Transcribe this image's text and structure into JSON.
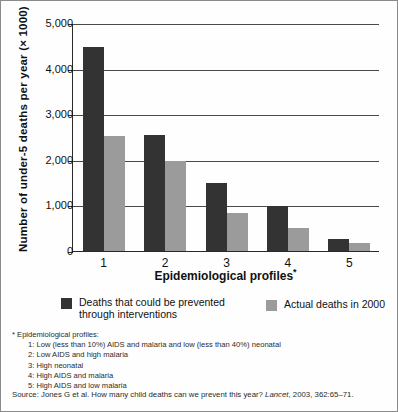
{
  "chart_data": {
    "type": "bar",
    "title": "",
    "xlabel": "Epidemiological profiles*",
    "ylabel": "Number of under-5 deaths per year (× 1000)",
    "categories": [
      "1",
      "2",
      "3",
      "4",
      "5"
    ],
    "ylim": [
      0,
      5000
    ],
    "yticks": [
      0,
      1000,
      2000,
      3000,
      4000,
      5000
    ],
    "ytick_labels": [
      "0",
      "1,000",
      "2,000",
      "3,000",
      "4,000",
      "5,000"
    ],
    "grid": true,
    "legend_position": "below",
    "series": [
      {
        "name": "Deaths that could be prevented through interventions",
        "color": "#333333",
        "values": [
          4470,
          2550,
          1500,
          980,
          270
        ]
      },
      {
        "name": "Actual deaths in 2000",
        "color": "#9b9b9b",
        "values": [
          2530,
          1970,
          830,
          500,
          170
        ]
      }
    ]
  },
  "axes": {
    "y_title": "Number of under-5 deaths per year (× 1000)",
    "x_title_main": "Epidemiological profiles",
    "x_title_marker": "*",
    "y_tick_labels": [
      "5,000",
      "4,000",
      "3,000",
      "2,000",
      "1,000",
      "0"
    ],
    "x_tick_labels": [
      "1",
      "2",
      "3",
      "4",
      "5"
    ]
  },
  "legend": {
    "items": [
      {
        "label": "Deaths that could be prevented through interventions",
        "color": "#333333"
      },
      {
        "label": "Actual deaths in 2000",
        "color": "#9b9b9b"
      }
    ]
  },
  "footnotes": {
    "heading": "* Epidemiological profiles:",
    "items": [
      "1: Low (less than 10%) AIDS and malaria and low (less than 40%) neonatal",
      "2: Low AIDS and high malaria",
      "3: High neonatal",
      "4: High AIDS and malaria",
      "5: High AIDS and low malaria"
    ]
  },
  "source": {
    "prefix": "Source: Jones G et al. How many child deaths can we prevent this year? ",
    "journal": "Lancet",
    "suffix": ", 2003, 362:65–71."
  }
}
